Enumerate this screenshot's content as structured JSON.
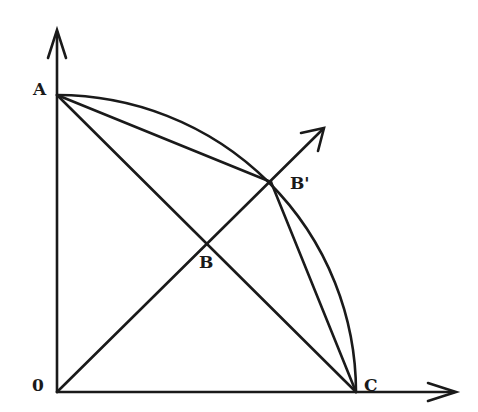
{
  "diagram": {
    "type": "geometric-construction",
    "points": {
      "origin": {
        "label": "0",
        "x": 57,
        "y": 392
      },
      "A": {
        "label": "A",
        "x": 57,
        "y": 95
      },
      "C": {
        "label": "C",
        "x": 356,
        "y": 392
      },
      "B": {
        "label": "B",
        "x": 207,
        "y": 243
      },
      "B_prime": {
        "label": "B'",
        "x": 271,
        "y": 182
      }
    },
    "axes": {
      "y_axis_tip": {
        "x": 57,
        "y": 30
      },
      "x_axis_tip": {
        "x": 456,
        "y": 392
      },
      "diagonal_tip": {
        "x": 324,
        "y": 128
      }
    },
    "labels": {
      "A": "A",
      "B": "B",
      "B_prime": "B'",
      "C": "C",
      "origin": "0"
    },
    "segments": [
      "A-C",
      "A-B'",
      "B'-C",
      "0-diagonal-ray",
      "arc A-C"
    ],
    "colors": {
      "stroke": "#1a1a1a",
      "background": "#ffffff"
    }
  }
}
